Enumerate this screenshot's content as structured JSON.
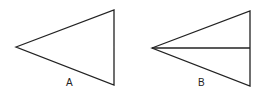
{
  "figures": [
    {
      "id": "A",
      "label": "A",
      "left_vertex": [
        16,
        47
      ],
      "top_right": [
        114,
        10
      ],
      "bottom_right": [
        114,
        85
      ],
      "has_midline": false
    },
    {
      "id": "B",
      "label": "B",
      "left_vertex": [
        152,
        48
      ],
      "top_right": [
        250,
        11
      ],
      "bottom_right": [
        250,
        86
      ],
      "midline_end": [
        250,
        48
      ],
      "has_midline": true
    }
  ],
  "colors": {
    "stroke": "#222222",
    "background": "#ffffff"
  }
}
